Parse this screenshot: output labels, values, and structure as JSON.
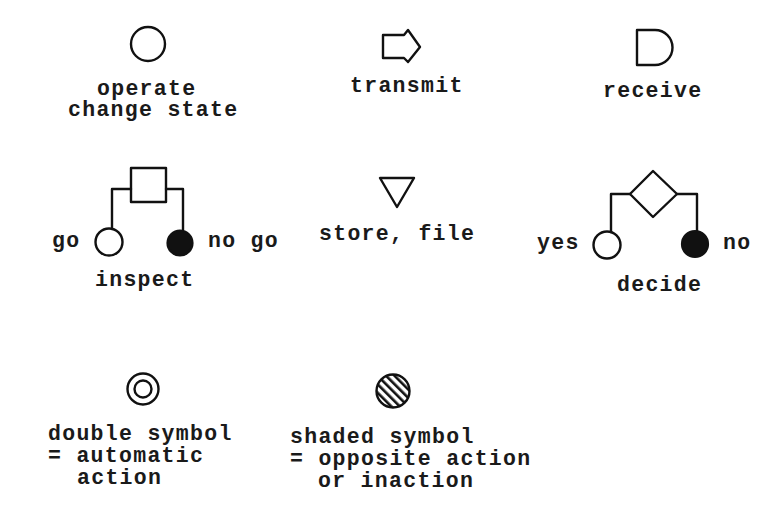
{
  "symbols": {
    "operate": {
      "icon": "open-circle",
      "label_line1": "operate",
      "label_line2": "change state"
    },
    "transmit": {
      "icon": "pentagon-arrow",
      "label": "transmit"
    },
    "receive": {
      "icon": "d-shape",
      "label": "receive"
    },
    "inspect": {
      "icon": "square-with-branches",
      "left_label": "go",
      "right_label": "no go",
      "label": "inspect"
    },
    "store": {
      "icon": "inverted-triangle",
      "label": "store, file"
    },
    "decide": {
      "icon": "diamond-with-branches",
      "left_label": "yes",
      "right_label": "no",
      "label": "decide"
    }
  },
  "modifiers": {
    "double": {
      "icon": "double-circle",
      "line1": "double symbol",
      "line2": "= automatic",
      "line3": "action"
    },
    "shaded": {
      "icon": "hatched-circle",
      "line1": "shaded symbol",
      "line2": "= opposite action",
      "line3": "or inaction"
    }
  },
  "colors": {
    "ink": "#111111",
    "paper": "#ffffff"
  }
}
